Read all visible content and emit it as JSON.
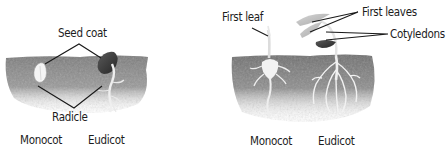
{
  "figure": {
    "panels": [
      {
        "id": "early-germination",
        "labels": {
          "seed_coat": "Seed coat",
          "radicle": "Radicle",
          "monocot": "Monocot",
          "eudicot": "Eudicot"
        }
      },
      {
        "id": "seedling",
        "labels": {
          "first_leaf": "First leaf",
          "first_leaves": "First leaves",
          "cotyledons": "Cotyledons",
          "monocot": "Monocot",
          "eudicot": "Eudicot"
        }
      }
    ],
    "colors": {
      "soil": "#8a8a8a",
      "soil_dark": "#6e6e6e",
      "root": "#f2f2f2",
      "seed_dark": "#3a3a3a",
      "leader_line": "#1a1a1a",
      "text": "#1c1c1c"
    }
  }
}
